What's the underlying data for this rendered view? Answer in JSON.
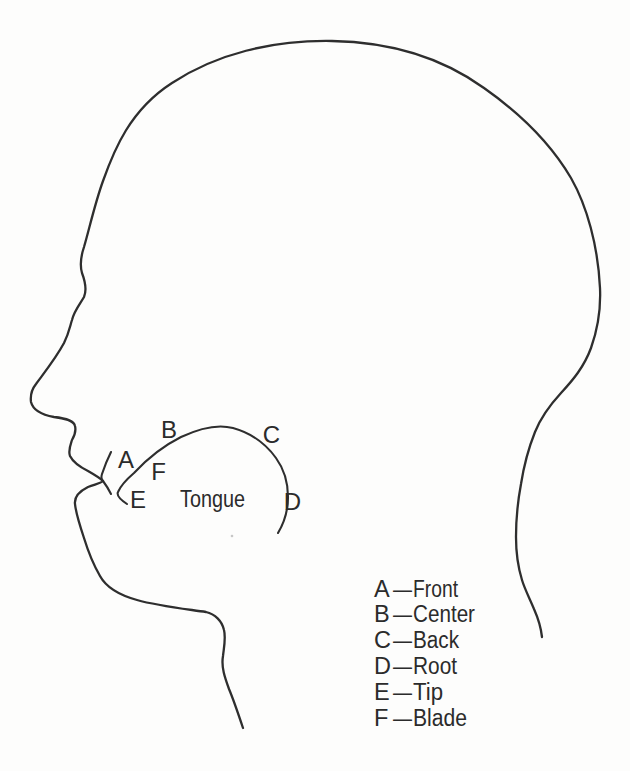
{
  "diagram": {
    "figure_label": "Tongue",
    "region_markers": [
      {
        "letter": "A"
      },
      {
        "letter": "B"
      },
      {
        "letter": "C"
      },
      {
        "letter": "D"
      },
      {
        "letter": "E"
      },
      {
        "letter": "F"
      }
    ],
    "legend": {
      "dash": "—",
      "items": [
        {
          "letter": "A",
          "name": "Front"
        },
        {
          "letter": "B",
          "name": "Center"
        },
        {
          "letter": "C",
          "name": "Back"
        },
        {
          "letter": "D",
          "name": "Root"
        },
        {
          "letter": "E",
          "name": "Tip"
        },
        {
          "letter": "F",
          "name": "Blade"
        }
      ]
    },
    "colors": {
      "ink": "#2e2e2e",
      "paper": "#fdfdfc"
    }
  }
}
